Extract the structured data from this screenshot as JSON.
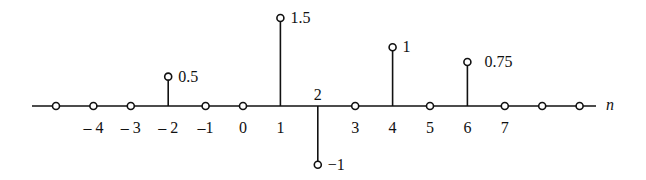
{
  "chart_data": {
    "type": "stem",
    "title": "",
    "xlabel": "n",
    "ylabel": "",
    "x": [
      -5,
      -4,
      -3,
      -2,
      -1,
      0,
      1,
      2,
      3,
      4,
      5,
      6,
      7,
      8,
      9
    ],
    "values": [
      0,
      0,
      0,
      0.5,
      0,
      0,
      1.5,
      -1,
      0,
      1,
      0,
      0.75,
      0,
      0,
      0
    ],
    "tick_labels": [
      "-4",
      "-3",
      "-2",
      "-1",
      "0",
      "1",
      "2",
      "3",
      "4",
      "5",
      "6",
      "7"
    ],
    "value_labels": [
      {
        "n": -2,
        "label": "0.5"
      },
      {
        "n": 1,
        "label": "1.5"
      },
      {
        "n": 2,
        "label": "−1"
      },
      {
        "n": 4,
        "label": "1"
      },
      {
        "n": 6,
        "label": "0.75"
      }
    ],
    "grid": false,
    "marker": "open-circle",
    "colors": {
      "stroke": "#111111",
      "background": "#ffffff"
    }
  },
  "axis_label": "n"
}
